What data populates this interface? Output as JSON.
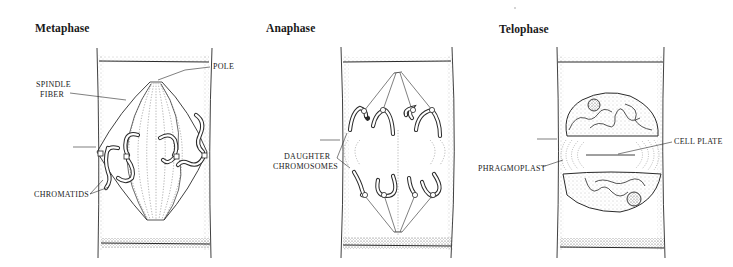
{
  "figure": {
    "panels": [
      {
        "id": "metaphase",
        "title": "Metaphase",
        "labels": {
          "pole": "POLE",
          "spindle_fiber_line1": "SPINDLE",
          "spindle_fiber_line2": "FIBER",
          "chromatids": "CHROMATIDS"
        }
      },
      {
        "id": "anaphase",
        "title": "Anaphase",
        "labels": {
          "daughter_line1": "DAUGHTER",
          "daughter_line2": "CHROMOSOMES"
        }
      },
      {
        "id": "telophase",
        "title": "Telophase",
        "labels": {
          "cell_plate": "CELL PLATE",
          "phragmoplast": "PHRAGMOPLAST"
        }
      }
    ],
    "colors": {
      "ink": "#2a2a2a",
      "stipple": "#9a9a9a",
      "background": "#ffffff"
    }
  }
}
